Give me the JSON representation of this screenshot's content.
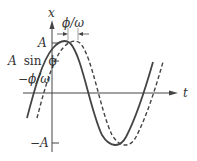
{
  "diagram": {
    "title": "",
    "axes": {
      "vertical_label": "x",
      "horizontal_label": "t"
    },
    "labels": {
      "amplitude": "A",
      "neg_amplitude": "−A",
      "intercept_prefix": "A",
      "intercept_func": "sin",
      "intercept_phi": "ϕ",
      "neg_time_shift": "−ϕ/ω",
      "shift_label": "ϕ/ω"
    },
    "curves": [
      {
        "name": "solid",
        "style": "solid",
        "description": "x = A cos(ωt − ϕ) shifted left / phase-advanced"
      },
      {
        "name": "dashed",
        "style": "dashed",
        "description": "reference sinusoid"
      }
    ],
    "colors": {
      "stroke": "#333333",
      "axis": "#555555",
      "background": "#ffffff"
    }
  }
}
